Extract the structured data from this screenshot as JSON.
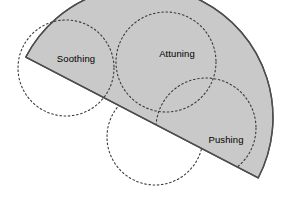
{
  "diagram": {
    "type": "venn-semicircle",
    "title": "",
    "background_color": "#ffffff",
    "half_disk": {
      "name": "shaded-half-disk",
      "fill_color": "#c9c9c9",
      "stroke_color": "#4d4d4d",
      "stroke_width": 1.4,
      "center_x": 142,
      "center_y": 117.5,
      "radius": 131,
      "rotation_deg": 27.5
    },
    "dashed_style": {
      "stroke_color": "#3a3a3a",
      "stroke_width": 1.1,
      "dash_pattern": "1.6 2.6"
    },
    "circles": [
      {
        "name": "soothing-circle",
        "label": "Soothing",
        "cx": 66,
        "cy": 68,
        "r": 48,
        "label_x": 76,
        "label_y": 59,
        "clipped": true
      },
      {
        "name": "attuning-circle",
        "label": "Attuning",
        "cx": 166,
        "cy": 62,
        "r": 50,
        "label_x": 177,
        "label_y": 54,
        "clipped": false
      },
      {
        "name": "pushing-circle",
        "label": "Pushing",
        "cx": 206,
        "cy": 128,
        "r": 50,
        "label_x": 226,
        "label_y": 140,
        "clipped": false
      },
      {
        "name": "lower-left-circle",
        "label": "",
        "cx": 66,
        "cy": 68,
        "r": 48,
        "label_x": 0,
        "label_y": 0,
        "clipped": false
      },
      {
        "name": "bottom-center-circle",
        "label": "",
        "cx": 155,
        "cy": 137,
        "r": 48,
        "label_x": 0,
        "label_y": 0,
        "clipped": false
      }
    ],
    "labels": {
      "soothing": "Soothing",
      "attuning": "Attuning",
      "pushing": "Pushing"
    }
  }
}
